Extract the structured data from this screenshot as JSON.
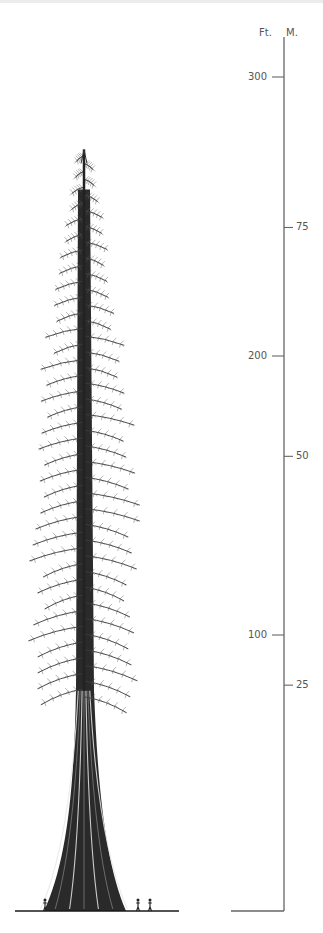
{
  "figure": {
    "scale": {
      "feet_label": "Ft.",
      "meters_label": "M.",
      "feet_ticks": [
        {
          "value": 300,
          "label": "300"
        },
        {
          "value": 200,
          "label": "200"
        },
        {
          "value": 100,
          "label": "100"
        }
      ],
      "meter_ticks": [
        {
          "value": 75,
          "label": "75"
        },
        {
          "value": 50,
          "label": "50"
        },
        {
          "value": 25,
          "label": "25"
        }
      ],
      "axis_max_ft": 313
    },
    "tree": {
      "height_ft": 274,
      "crown_base_ft": 80
    },
    "people_count": 3,
    "colors": {
      "ink": "#1a1a1a",
      "axis": "#666666",
      "label": "#555555",
      "foliage": "#3a3a3a"
    }
  }
}
